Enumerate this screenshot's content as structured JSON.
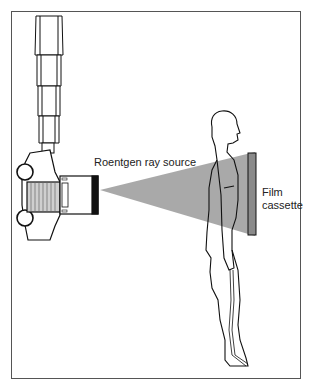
{
  "diagram": {
    "labels": {
      "source": "Roentgen ray source",
      "film_line1": "Film",
      "film_line2": "cassette"
    },
    "colors": {
      "beam": "#9a9a9a",
      "cassette": "#8a8a8a",
      "outline": "#111111",
      "frame": "#555555"
    }
  }
}
